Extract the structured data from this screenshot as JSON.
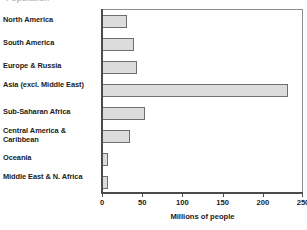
{
  "figure": {
    "cut_off_title": "Population"
  },
  "chart_data": {
    "type": "bar",
    "orientation": "horizontal",
    "title": "",
    "xlabel": "Millions of people",
    "ylabel": "",
    "xlim": [
      0,
      250
    ],
    "xticks": [
      0,
      50,
      100,
      150,
      200,
      250
    ],
    "xtick_labels": [
      "0",
      "50",
      "100",
      "150",
      "200",
      "250"
    ],
    "grid": false,
    "legend": "none",
    "bar_fill_color": "#dcdcdc",
    "bar_edge_color": "#6e6e6e",
    "axis_color": "#4d4d4d",
    "categories": [
      "North America",
      "South America",
      "Europe & Russia",
      "Asia (excl. Middle East)",
      "Sub-Saharan Africa",
      "Central America & Caribbean",
      "Oceania",
      "Middle East & N. Africa"
    ],
    "values": [
      31,
      40,
      44,
      231,
      54,
      35,
      7,
      7
    ]
  }
}
